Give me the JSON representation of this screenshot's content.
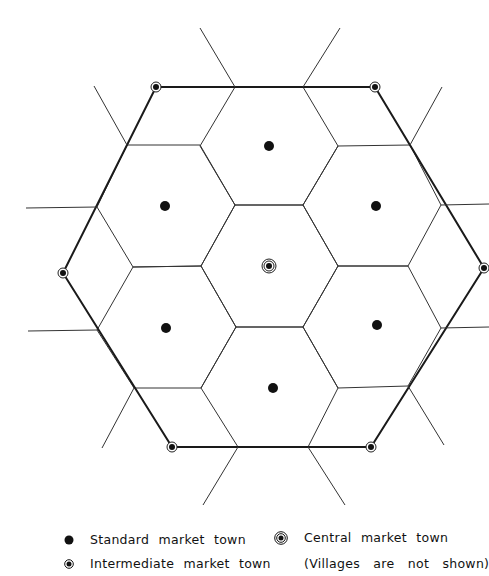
{
  "figure": {
    "type": "hexagonal central-place market hierarchy",
    "colors": {
      "line": "#222222",
      "dot": "#111111",
      "background": "#ffffff"
    },
    "central_town": {
      "x": 269,
      "y": 266
    },
    "standard_towns": [
      {
        "x": 269,
        "y": 146
      },
      {
        "x": 165,
        "y": 206
      },
      {
        "x": 376,
        "y": 206
      },
      {
        "x": 166,
        "y": 328
      },
      {
        "x": 377,
        "y": 325
      },
      {
        "x": 273,
        "y": 388
      }
    ],
    "intermediate_towns": [
      {
        "x": 156,
        "y": 87
      },
      {
        "x": 375,
        "y": 87
      },
      {
        "x": 484,
        "y": 268
      },
      {
        "x": 371,
        "y": 447
      },
      {
        "x": 172,
        "y": 447
      },
      {
        "x": 63,
        "y": 273
      }
    ]
  },
  "legend": {
    "standard": {
      "icon": "filled-dot-icon",
      "label": "Standard market town"
    },
    "intermediate": {
      "icon": "ringed-dot-icon",
      "label": "Intermediate market town"
    },
    "central": {
      "icon": "double-ringed-dot-icon",
      "label": "Central market town"
    },
    "note": "(Villages are not shown)"
  }
}
